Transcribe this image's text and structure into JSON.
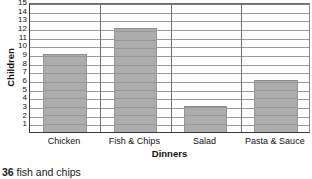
{
  "chart_data": {
    "type": "bar",
    "title": "",
    "categories": [
      "Chicken",
      "Fish & Chips",
      "Salad",
      "Pasta & Sauce"
    ],
    "values": [
      9,
      12,
      3,
      6
    ],
    "xlabel": "Dinners",
    "ylabel": "Children",
    "ylim": [
      0,
      15
    ],
    "ytick_labels": [
      "1",
      "2",
      "3",
      "4",
      "5",
      "6",
      "7",
      "8",
      "9",
      "10",
      "11",
      "12",
      "13",
      "14",
      "15"
    ],
    "ytick_values": [
      1,
      2,
      3,
      4,
      5,
      6,
      7,
      8,
      9,
      10,
      11,
      12,
      13,
      14,
      15
    ],
    "grid": true,
    "legend": false,
    "bar_color": "#acacac",
    "grid_color": "#9a9a9a",
    "axis_color": "#3a3a3a"
  },
  "caption": {
    "number": "36",
    "text": "fish and chips"
  }
}
